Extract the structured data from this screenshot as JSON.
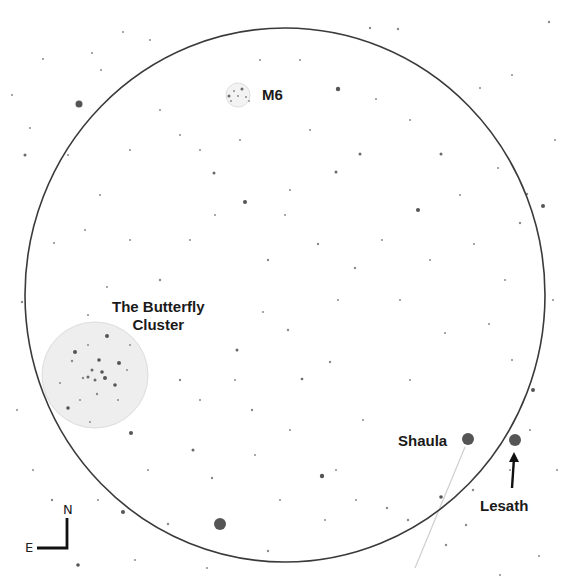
{
  "chart": {
    "background": "#ffffff",
    "field_of_view": {
      "cx": 285,
      "cy": 295,
      "rx": 260,
      "ry": 267,
      "stroke": "#3a3a3a",
      "stroke_width": 1.6
    },
    "objects": [
      {
        "id": "m6",
        "label": "M6",
        "type": "open-cluster",
        "cx": 238,
        "cy": 95,
        "r": 12,
        "label_x": 262,
        "label_y": 86
      },
      {
        "id": "butterfly",
        "label_line1": "The Butterfly",
        "label_line2": "Cluster",
        "type": "open-cluster",
        "cx": 95,
        "cy": 375,
        "r": 53,
        "label_x": 112,
        "label_y": 298
      }
    ],
    "named_stars": [
      {
        "id": "shaula",
        "label": "Shaula",
        "cx": 468,
        "cy": 439,
        "r": 6,
        "label_x": 398,
        "label_y": 432
      },
      {
        "id": "lesath",
        "label": "Lesath",
        "cx": 515,
        "cy": 440,
        "r": 6,
        "label_x": 480,
        "label_y": 497
      }
    ],
    "shaula_line": {
      "x1": 465,
      "y1": 447,
      "x2": 415,
      "y2": 568
    },
    "lesath_arrow": {
      "x1": 512,
      "y1": 488,
      "x2": 514,
      "y2": 452
    },
    "compass": {
      "north": "N",
      "east": "E",
      "corner_x": 67,
      "corner_y": 548,
      "north_len": 30,
      "east_len": 30
    },
    "bright_stars": [
      {
        "cx": 79,
        "cy": 104,
        "r": 3.5
      },
      {
        "cx": 220,
        "cy": 524,
        "r": 6
      },
      {
        "cx": 338,
        "cy": 89,
        "r": 2.2
      },
      {
        "cx": 322,
        "cy": 476,
        "r": 2.2
      },
      {
        "cx": 131,
        "cy": 433,
        "r": 2
      },
      {
        "cx": 123,
        "cy": 512,
        "r": 2
      },
      {
        "cx": 418,
        "cy": 210,
        "r": 2
      },
      {
        "cx": 543,
        "cy": 206,
        "r": 2
      },
      {
        "cx": 533,
        "cy": 390,
        "r": 2
      },
      {
        "cx": 245,
        "cy": 202,
        "r": 2
      },
      {
        "cx": 441,
        "cy": 497,
        "r": 1.8
      },
      {
        "cx": 78,
        "cy": 565,
        "r": 1.8
      },
      {
        "cx": 25,
        "cy": 155,
        "r": 1.5
      },
      {
        "cx": 214,
        "cy": 173,
        "r": 1.5
      },
      {
        "cx": 360,
        "cy": 154,
        "r": 1.5
      },
      {
        "cx": 441,
        "cy": 154,
        "r": 1.5
      },
      {
        "cx": 336,
        "cy": 172,
        "r": 1.5
      },
      {
        "cx": 370,
        "cy": 28,
        "r": 1.2
      },
      {
        "cx": 398,
        "cy": 29,
        "r": 1.2
      },
      {
        "cx": 549,
        "cy": 22,
        "r": 1.2
      },
      {
        "cx": 520,
        "cy": 223,
        "r": 1.2
      },
      {
        "cx": 527,
        "cy": 194,
        "r": 1.2
      },
      {
        "cx": 237,
        "cy": 350,
        "r": 1.5
      },
      {
        "cx": 302,
        "cy": 379,
        "r": 1.3
      },
      {
        "cx": 330,
        "cy": 362,
        "r": 1.2
      },
      {
        "cx": 180,
        "cy": 380,
        "r": 1.2
      },
      {
        "cx": 252,
        "cy": 410,
        "r": 1.2
      },
      {
        "cx": 193,
        "cy": 450,
        "r": 1.5
      },
      {
        "cx": 212,
        "cy": 478,
        "r": 1.2
      },
      {
        "cx": 355,
        "cy": 268,
        "r": 1.2
      },
      {
        "cx": 268,
        "cy": 260,
        "r": 1.2
      },
      {
        "cx": 318,
        "cy": 244,
        "r": 1.2
      },
      {
        "cx": 473,
        "cy": 490,
        "r": 1.2
      },
      {
        "cx": 466,
        "cy": 525,
        "r": 1.2
      },
      {
        "cx": 446,
        "cy": 545,
        "r": 1.2
      },
      {
        "cx": 160,
        "cy": 280,
        "r": 1.2
      },
      {
        "cx": 288,
        "cy": 330,
        "r": 1.2
      },
      {
        "cx": 52,
        "cy": 500,
        "r": 1.2
      },
      {
        "cx": 168,
        "cy": 524,
        "r": 1.2
      },
      {
        "cx": 268,
        "cy": 551,
        "r": 1.2
      },
      {
        "cx": 387,
        "cy": 508,
        "r": 1.2
      },
      {
        "cx": 408,
        "cy": 520,
        "r": 1.2
      },
      {
        "cx": 22,
        "cy": 302,
        "r": 1.2
      },
      {
        "cx": 12,
        "cy": 95,
        "r": 1.0
      },
      {
        "cx": 68,
        "cy": 155,
        "r": 1.0
      },
      {
        "cx": 43,
        "cy": 59,
        "r": 1.0
      },
      {
        "cx": 123,
        "cy": 32,
        "r": 1.0
      },
      {
        "cx": 150,
        "cy": 40,
        "r": 1.0
      },
      {
        "cx": 92,
        "cy": 53,
        "r": 1.0
      },
      {
        "cx": 101,
        "cy": 70,
        "r": 1.0
      },
      {
        "cx": 30,
        "cy": 128,
        "r": 1.0
      },
      {
        "cx": 54,
        "cy": 243,
        "r": 1.0
      },
      {
        "cx": 107,
        "cy": 287,
        "r": 1.0
      },
      {
        "cx": 88,
        "cy": 315,
        "r": 1.0
      },
      {
        "cx": 376,
        "cy": 99,
        "r": 1.0
      },
      {
        "cx": 480,
        "cy": 88,
        "r": 1.0
      },
      {
        "cx": 512,
        "cy": 75,
        "r": 1.0
      },
      {
        "cx": 474,
        "cy": 244,
        "r": 1.0
      },
      {
        "cx": 445,
        "cy": 333,
        "r": 1.0
      },
      {
        "cx": 489,
        "cy": 324,
        "r": 1.0
      },
      {
        "cx": 510,
        "cy": 470,
        "r": 1.0
      },
      {
        "cx": 530,
        "cy": 430,
        "r": 1.0
      },
      {
        "cx": 539,
        "cy": 556,
        "r": 1.0
      },
      {
        "cx": 500,
        "cy": 575,
        "r": 1.0
      },
      {
        "cx": 207,
        "cy": 568,
        "r": 1.0
      },
      {
        "cx": 135,
        "cy": 560,
        "r": 1.0
      },
      {
        "cx": 98,
        "cy": 500,
        "r": 1.0
      },
      {
        "cx": 33,
        "cy": 470,
        "r": 1.0
      },
      {
        "cx": 17,
        "cy": 410,
        "r": 1.0
      },
      {
        "cx": 148,
        "cy": 470,
        "r": 1.0
      },
      {
        "cx": 336,
        "cy": 470,
        "r": 1.0
      },
      {
        "cx": 363,
        "cy": 420,
        "r": 1.0
      },
      {
        "cx": 338,
        "cy": 300,
        "r": 1.0
      },
      {
        "cx": 400,
        "cy": 300,
        "r": 1.0
      },
      {
        "cx": 410,
        "cy": 380,
        "r": 1.0
      },
      {
        "cx": 430,
        "cy": 260,
        "r": 1.0
      },
      {
        "cx": 382,
        "cy": 240,
        "r": 1.0
      },
      {
        "cx": 290,
        "cy": 190,
        "r": 1.0
      },
      {
        "cx": 263,
        "cy": 312,
        "r": 1.0
      },
      {
        "cx": 235,
        "cy": 380,
        "r": 1.0
      },
      {
        "cx": 200,
        "cy": 400,
        "r": 1.0
      },
      {
        "cx": 290,
        "cy": 430,
        "r": 1.0
      },
      {
        "cx": 255,
        "cy": 455,
        "r": 1.0
      },
      {
        "cx": 280,
        "cy": 500,
        "r": 1.0
      },
      {
        "cx": 325,
        "cy": 520,
        "r": 1.0
      },
      {
        "cx": 356,
        "cy": 500,
        "r": 1.0
      },
      {
        "cx": 240,
        "cy": 140,
        "r": 1.0
      },
      {
        "cx": 200,
        "cy": 150,
        "r": 1.0
      },
      {
        "cx": 180,
        "cy": 135,
        "r": 1.0
      },
      {
        "cx": 160,
        "cy": 110,
        "r": 1.0
      },
      {
        "cx": 130,
        "cy": 150,
        "r": 1.0
      },
      {
        "cx": 100,
        "cy": 195,
        "r": 1.0
      },
      {
        "cx": 85,
        "cy": 230,
        "r": 1.0
      },
      {
        "cx": 130,
        "cy": 240,
        "r": 1.0
      },
      {
        "cx": 190,
        "cy": 240,
        "r": 1.0
      },
      {
        "cx": 215,
        "cy": 215,
        "r": 1.0
      },
      {
        "cx": 285,
        "cy": 215,
        "r": 1.0
      },
      {
        "cx": 310,
        "cy": 130,
        "r": 1.0
      },
      {
        "cx": 300,
        "cy": 60,
        "r": 1.0
      },
      {
        "cx": 260,
        "cy": 60,
        "r": 1.0
      },
      {
        "cx": 410,
        "cy": 120,
        "r": 1.0
      },
      {
        "cx": 460,
        "cy": 195,
        "r": 1.0
      },
      {
        "cx": 498,
        "cy": 168,
        "r": 1.0
      },
      {
        "cx": 505,
        "cy": 280,
        "r": 1.0
      },
      {
        "cx": 512,
        "cy": 360,
        "r": 1.0
      },
      {
        "cx": 555,
        "cy": 140,
        "r": 1.0
      },
      {
        "cx": 553,
        "cy": 300,
        "r": 1.0
      },
      {
        "cx": 557,
        "cy": 470,
        "r": 1.0
      }
    ],
    "butterfly_members": [
      {
        "cx": 107,
        "cy": 336,
        "r": 2
      },
      {
        "cx": 75,
        "cy": 352,
        "r": 2
      },
      {
        "cx": 99,
        "cy": 360,
        "r": 1.8
      },
      {
        "cx": 119,
        "cy": 363,
        "r": 2
      },
      {
        "cx": 102,
        "cy": 372,
        "r": 1.8
      },
      {
        "cx": 92,
        "cy": 370,
        "r": 1.5
      },
      {
        "cx": 88,
        "cy": 377,
        "r": 1.5
      },
      {
        "cx": 95,
        "cy": 380,
        "r": 1.5
      },
      {
        "cx": 105,
        "cy": 378,
        "r": 2
      },
      {
        "cx": 83,
        "cy": 378,
        "r": 1.2
      },
      {
        "cx": 115,
        "cy": 385,
        "r": 1.8
      },
      {
        "cx": 72,
        "cy": 361,
        "r": 1.2
      },
      {
        "cx": 97,
        "cy": 394,
        "r": 1.2
      },
      {
        "cx": 68,
        "cy": 408,
        "r": 1.8
      },
      {
        "cx": 60,
        "cy": 383,
        "r": 1.0
      },
      {
        "cx": 127,
        "cy": 370,
        "r": 1.0
      },
      {
        "cx": 80,
        "cy": 400,
        "r": 1.0
      },
      {
        "cx": 118,
        "cy": 400,
        "r": 1.0
      },
      {
        "cx": 88,
        "cy": 345,
        "r": 1.0
      },
      {
        "cx": 130,
        "cy": 345,
        "r": 1.0
      },
      {
        "cx": 90,
        "cy": 422,
        "r": 1.0
      }
    ],
    "m6_members": [
      {
        "cx": 229,
        "cy": 96,
        "r": 1.5
      },
      {
        "cx": 242,
        "cy": 89,
        "r": 1.5
      },
      {
        "cx": 238,
        "cy": 96,
        "r": 1.0
      },
      {
        "cx": 246,
        "cy": 97,
        "r": 1.0
      },
      {
        "cx": 234,
        "cy": 91,
        "r": 1.0
      },
      {
        "cx": 231,
        "cy": 101,
        "r": 1.0
      },
      {
        "cx": 249,
        "cy": 101,
        "r": 0.9
      }
    ],
    "colors": {
      "fov_stroke": "#3a3a3a",
      "cluster_fill": "#eeeeee",
      "cluster_stroke": "#dcdcdc",
      "named_star": "#555555",
      "bright_star": "#555555",
      "faint_star": "#8a8a8a",
      "line": "#cfcfcf",
      "arrow": "#111111",
      "text": "#1a1a1a"
    }
  }
}
